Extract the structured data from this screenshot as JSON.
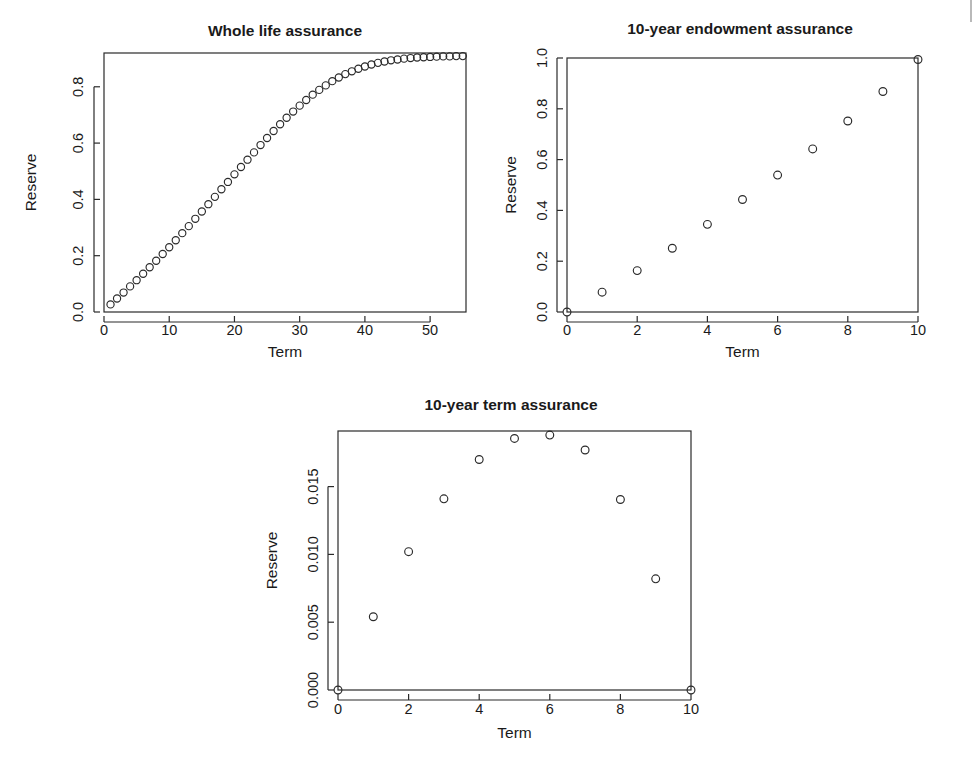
{
  "figure": {
    "background": "#ffffff",
    "foreground": "#2a2a2a",
    "layout": "three R base-graphics scatter panels: two on top row, one centered on bottom row"
  },
  "panels": [
    {
      "id": "whole-life-assurance",
      "title": "Whole life assurance",
      "xlabel": "Term",
      "ylabel": "Reserve"
    },
    {
      "id": "ten-year-endowment-assurance",
      "title": "10-year endowment assurance",
      "xlabel": "Term",
      "ylabel": "Reserve"
    },
    {
      "id": "ten-year-term-assurance",
      "title": "10-year term assurance",
      "xlabel": "Term",
      "ylabel": "Reserve"
    }
  ],
  "chart_data": [
    {
      "type": "scatter",
      "title": "Whole life assurance",
      "xlabel": "Term",
      "ylabel": "Reserve",
      "xlim": [
        0,
        55.5
      ],
      "ylim": [
        0.0,
        0.92
      ],
      "xticks": [
        0,
        10,
        20,
        30,
        40,
        50
      ],
      "xticklabels": [
        "0",
        "10",
        "20",
        "30",
        "40",
        "50"
      ],
      "yticks": [
        0.0,
        0.2,
        0.4,
        0.6,
        0.8
      ],
      "yticklabels": [
        "0.0",
        "0.2",
        "0.4",
        "0.6",
        "0.8"
      ],
      "grid": false,
      "legend": null,
      "marker": "open-circle",
      "x": [
        1,
        2,
        3,
        4,
        5,
        6,
        7,
        8,
        9,
        10,
        11,
        12,
        13,
        14,
        15,
        16,
        17,
        18,
        19,
        20,
        21,
        22,
        23,
        24,
        25,
        26,
        27,
        28,
        29,
        30,
        31,
        32,
        33,
        34,
        35,
        36,
        37,
        38,
        39,
        40,
        41,
        42,
        43,
        44,
        45,
        46,
        47,
        48,
        49,
        50,
        51,
        52,
        53,
        54,
        55
      ],
      "y": [
        0.027,
        0.048,
        0.069,
        0.091,
        0.113,
        0.136,
        0.159,
        0.182,
        0.206,
        0.23,
        0.255,
        0.28,
        0.305,
        0.331,
        0.357,
        0.383,
        0.409,
        0.436,
        0.462,
        0.489,
        0.515,
        0.541,
        0.567,
        0.593,
        0.618,
        0.643,
        0.667,
        0.69,
        0.712,
        0.733,
        0.753,
        0.772,
        0.789,
        0.805,
        0.82,
        0.833,
        0.845,
        0.855,
        0.864,
        0.872,
        0.879,
        0.885,
        0.89,
        0.894,
        0.897,
        0.9,
        0.902,
        0.904,
        0.905,
        0.906,
        0.907,
        0.908,
        0.908,
        0.909,
        0.909
      ]
    },
    {
      "type": "scatter",
      "title": "10-year endowment assurance",
      "xlabel": "Term",
      "ylabel": "Reserve",
      "xlim": [
        0,
        10
      ],
      "ylim": [
        0.0,
        1.0
      ],
      "xticks": [
        0,
        2,
        4,
        6,
        8,
        10
      ],
      "xticklabels": [
        "0",
        "2",
        "4",
        "6",
        "8",
        "10"
      ],
      "yticks": [
        0.0,
        0.2,
        0.4,
        0.6,
        0.8,
        1.0
      ],
      "yticklabels": [
        "0.0",
        "0.2",
        "0.4",
        "0.6",
        "0.8",
        "1.0"
      ],
      "grid": false,
      "legend": null,
      "marker": "open-circle",
      "x": [
        0,
        1,
        2,
        3,
        4,
        5,
        6,
        7,
        8,
        9,
        10
      ],
      "y": [
        0.0,
        0.078,
        0.163,
        0.251,
        0.345,
        0.443,
        0.539,
        0.642,
        0.752,
        0.868,
        0.994
      ]
    },
    {
      "type": "scatter",
      "title": "10-year term assurance",
      "xlabel": "Term",
      "ylabel": "Reserve",
      "xlim": [
        0,
        10
      ],
      "ylim": [
        0.0,
        0.0191
      ],
      "xticks": [
        0,
        2,
        4,
        6,
        8,
        10
      ],
      "xticklabels": [
        "0",
        "2",
        "4",
        "6",
        "8",
        "10"
      ],
      "yticks": [
        0.0,
        0.005,
        0.01,
        0.015
      ],
      "yticklabels": [
        "0.000",
        "0.005",
        "0.010",
        "0.015"
      ],
      "grid": false,
      "legend": null,
      "marker": "open-circle",
      "x": [
        0,
        1,
        2,
        3,
        4,
        5,
        6,
        7,
        8,
        9,
        10
      ],
      "y": [
        0.0,
        0.0054,
        0.0102,
        0.0141,
        0.017,
        0.01855,
        0.0188,
        0.0177,
        0.01405,
        0.0082,
        0.0
      ]
    }
  ]
}
